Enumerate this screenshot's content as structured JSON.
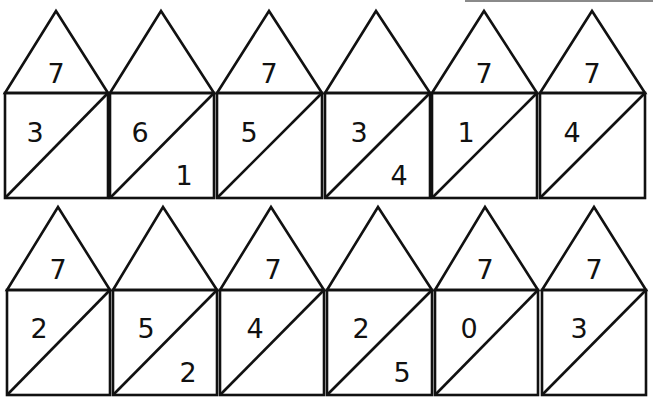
{
  "worksheet": {
    "title": "",
    "houses": [
      {
        "row": 1,
        "col": 1,
        "roof": "7",
        "left": "3",
        "right": ""
      },
      {
        "row": 1,
        "col": 2,
        "roof": "",
        "left": "6",
        "right": "1"
      },
      {
        "row": 1,
        "col": 3,
        "roof": "7",
        "left": "5",
        "right": ""
      },
      {
        "row": 1,
        "col": 4,
        "roof": "",
        "left": "3",
        "right": "4"
      },
      {
        "row": 1,
        "col": 5,
        "roof": "7",
        "left": "1",
        "right": ""
      },
      {
        "row": 1,
        "col": 6,
        "roof": "7",
        "left": "4",
        "right": ""
      },
      {
        "row": 2,
        "col": 1,
        "roof": "7",
        "left": "2",
        "right": ""
      },
      {
        "row": 2,
        "col": 2,
        "roof": "",
        "left": "5",
        "right": "2"
      },
      {
        "row": 2,
        "col": 3,
        "roof": "7",
        "left": "4",
        "right": ""
      },
      {
        "row": 2,
        "col": 4,
        "roof": "",
        "left": "2",
        "right": "5"
      },
      {
        "row": 2,
        "col": 5,
        "roof": "7",
        "left": "0",
        "right": ""
      },
      {
        "row": 2,
        "col": 6,
        "roof": "7",
        "left": "3",
        "right": ""
      }
    ],
    "colors": {
      "line": "#111111",
      "background": "#ffffff"
    }
  }
}
